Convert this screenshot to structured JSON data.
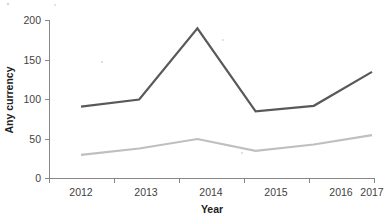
{
  "chart_data": {
    "type": "line",
    "title": "",
    "xlabel": "Year",
    "ylabel": "Any currency",
    "categories": [
      "2012",
      "2013",
      "2014",
      "2015",
      "2016",
      "2017"
    ],
    "yticks": [
      "0",
      "50",
      "100",
      "150",
      "200"
    ],
    "ylim": [
      0,
      200
    ],
    "grid": false,
    "legend": "none",
    "series": [
      {
        "name": "dark-series",
        "color": "#595959",
        "values": [
          91,
          100,
          190,
          85,
          92,
          135
        ]
      },
      {
        "name": "light-series",
        "color": "#bfbfbf",
        "values": [
          30,
          38,
          50,
          35,
          43,
          55
        ]
      }
    ]
  },
  "axes": {
    "y_title": "Any currency",
    "x_title": "Year",
    "y_tick_0": "0",
    "y_tick_1": "50",
    "y_tick_2": "100",
    "y_tick_3": "150",
    "y_tick_4": "200",
    "x_tick_0": "2012",
    "x_tick_1": "2013",
    "x_tick_2": "2014",
    "x_tick_3": "2015",
    "x_tick_4": "2016",
    "x_tick_5": "2017"
  }
}
